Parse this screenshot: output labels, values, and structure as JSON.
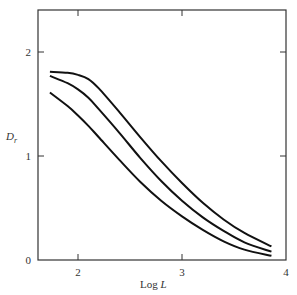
{
  "chart_data": {
    "type": "line",
    "title": "",
    "xlabel": "Log L",
    "ylabel": "D_r",
    "xlabel_main": "Log ",
    "xlabel_italic": "L",
    "ylabel_main": "D",
    "ylabel_sub": "r",
    "xlim": [
      1.6,
      4.0
    ],
    "ylim": [
      0,
      2.4
    ],
    "xticks": [
      2,
      3,
      4
    ],
    "yticks": [
      0,
      1,
      2
    ],
    "xtick_labels": [
      "2",
      "3",
      "4"
    ],
    "ytick_labels": [
      "0",
      "1",
      "2"
    ],
    "grid": false,
    "legend": null,
    "series": [
      {
        "name": "curve-upper",
        "x": [
          1.73,
          1.9,
          2.0,
          2.1,
          2.2,
          2.4,
          2.6,
          2.8,
          3.0,
          3.2,
          3.4,
          3.6,
          3.86
        ],
        "y": [
          1.81,
          1.8,
          1.78,
          1.74,
          1.65,
          1.42,
          1.18,
          0.95,
          0.74,
          0.55,
          0.39,
          0.26,
          0.13
        ]
      },
      {
        "name": "curve-middle",
        "x": [
          1.73,
          1.9,
          2.0,
          2.1,
          2.2,
          2.4,
          2.6,
          2.8,
          3.0,
          3.2,
          3.4,
          3.6,
          3.86
        ],
        "y": [
          1.77,
          1.7,
          1.64,
          1.56,
          1.45,
          1.22,
          0.98,
          0.76,
          0.57,
          0.41,
          0.28,
          0.17,
          0.08
        ]
      },
      {
        "name": "curve-lower",
        "x": [
          1.73,
          1.9,
          2.0,
          2.1,
          2.2,
          2.4,
          2.6,
          2.8,
          3.0,
          3.2,
          3.4,
          3.6,
          3.86
        ],
        "y": [
          1.61,
          1.48,
          1.39,
          1.29,
          1.18,
          0.96,
          0.75,
          0.57,
          0.42,
          0.29,
          0.18,
          0.1,
          0.04
        ]
      }
    ]
  }
}
